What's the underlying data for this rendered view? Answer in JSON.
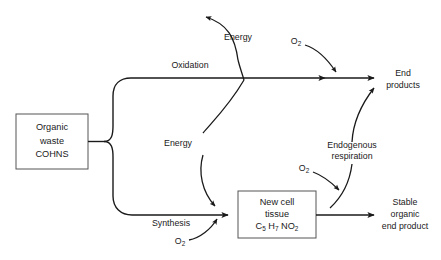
{
  "diagram": {
    "colors": {
      "line": "#1a1a1a",
      "box_border": "#555555",
      "background": "#ffffff"
    },
    "boxes": [
      {
        "id": "organic-waste",
        "lines": [
          "Organic",
          "waste",
          "COHNS"
        ]
      },
      {
        "id": "new-cell-tissue",
        "lines": [
          "New cell",
          "tissue"
        ],
        "formula": {
          "parts": [
            {
              "text": "C",
              "sub": "5"
            },
            {
              "text": " H",
              "sub": "7"
            },
            {
              "text": " NO",
              "sub": "2"
            }
          ]
        }
      }
    ],
    "edge_labels": {
      "oxidation": "Oxidation",
      "synthesis": "Synthesis",
      "energy_top": "Energy",
      "energy_mid": "Energy",
      "endogenous_line1": "Endogenous",
      "endogenous_line2": "respiration"
    },
    "oxygen_labels": [
      {
        "id": "o2-top-right",
        "text": "O",
        "sub": "2"
      },
      {
        "id": "o2-mid-right",
        "text": "O",
        "sub": "2"
      },
      {
        "id": "o2-bottom-left",
        "text": "O",
        "sub": "2"
      }
    ],
    "outputs": [
      {
        "id": "end-products",
        "lines": [
          "End",
          "products"
        ]
      },
      {
        "id": "stable-organic-end-product",
        "lines": [
          "Stable",
          "organic",
          "end product"
        ]
      }
    ]
  }
}
